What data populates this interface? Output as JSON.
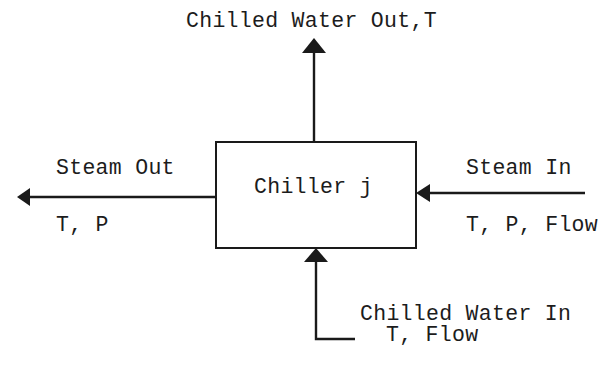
{
  "diagram": {
    "type": "process-block",
    "colors": {
      "stroke": "#1a1a1a",
      "text": "#1c1c1c",
      "background": "#ffffff"
    },
    "block": {
      "label": "Chiller j"
    },
    "streams": {
      "chilled_water_out": {
        "label": "Chilled Water Out,T",
        "direction": "up",
        "icon": "arrow-up-icon"
      },
      "steam_out": {
        "label": "Steam Out",
        "properties": "T, P",
        "direction": "left",
        "icon": "arrow-left-icon"
      },
      "steam_in": {
        "label": "Steam In",
        "properties": "T, P, Flow",
        "direction": "left",
        "icon": "arrow-left-icon"
      },
      "chilled_water_in": {
        "label": "Chilled Water In",
        "properties": "T, Flow",
        "direction": "up",
        "icon": "arrow-up-icon"
      }
    }
  }
}
